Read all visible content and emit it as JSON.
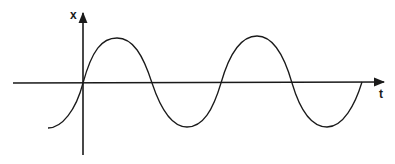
{
  "diagram": {
    "type": "sinusoid-plot",
    "axes": {
      "vertical_label": "x",
      "horizontal_label": "t"
    },
    "colors": {
      "stroke": "#1a1a1a",
      "background": "#ffffff"
    },
    "curve": {
      "shape": "sine",
      "description": "sine wave starting near a trough left of the vertical axis, crossing the origin upward, with two full peaks and two troughs to the right, ending at the t-axis"
    }
  }
}
